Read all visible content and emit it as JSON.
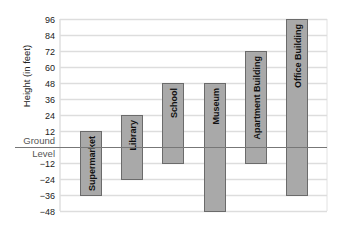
{
  "chart_data": {
    "type": "bar",
    "subtype": "floating-range",
    "title": "",
    "xlabel": "",
    "ylabel": "Height (in feet)",
    "ylim": [
      -48,
      96
    ],
    "yticks": [
      96,
      84,
      72,
      60,
      48,
      36,
      24,
      12,
      0,
      -12,
      -24,
      -36,
      -48
    ],
    "ytick_labels": [
      "96",
      "84",
      "72",
      "60",
      "48",
      "36",
      "24",
      "12",
      "",
      "−12",
      "−24",
      "−36",
      "−48"
    ],
    "zero_line_label": [
      "Ground",
      "Level"
    ],
    "grid": true,
    "legend": null,
    "categories": [
      "Supermarket",
      "Library",
      "School",
      "Museum",
      "Apartment Building",
      "Office Building"
    ],
    "series": [
      {
        "name": "Top",
        "values": [
          12,
          24,
          48,
          48,
          72,
          96
        ]
      },
      {
        "name": "Bottom",
        "values": [
          -36,
          -24,
          -12,
          -48,
          -12,
          -36
        ]
      }
    ],
    "bars": [
      {
        "label": "Supermarket",
        "top": 12,
        "bottom": -36
      },
      {
        "label": "Library",
        "top": 24,
        "bottom": -24
      },
      {
        "label": "School",
        "top": 48,
        "bottom": -12
      },
      {
        "label": "Museum",
        "top": 48,
        "bottom": -48
      },
      {
        "label": "Apartment Building",
        "top": 72,
        "bottom": -12
      },
      {
        "label": "Office Building",
        "top": 96,
        "bottom": -36
      }
    ],
    "colors": {
      "bar": "#a9a9a9",
      "bar_border": "#6b6b6b",
      "grid": "#dddddd",
      "ground": "#777777"
    }
  }
}
